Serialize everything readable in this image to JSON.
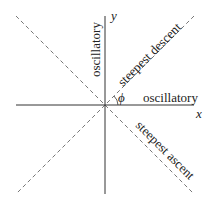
{
  "diagram": {
    "axes": {
      "x_label": "x",
      "y_label": "y"
    },
    "angle_label": "ϕ",
    "regions": {
      "vertical_axis_label": "oscillatory",
      "horizontal_axis_label": "oscillatory",
      "upper_right_diagonal_label": "steepest descent",
      "lower_right_diagonal_label": "steepest ascent"
    },
    "colors": {
      "axis": "#333333",
      "dashed": "#777777",
      "text": "#222222"
    }
  }
}
